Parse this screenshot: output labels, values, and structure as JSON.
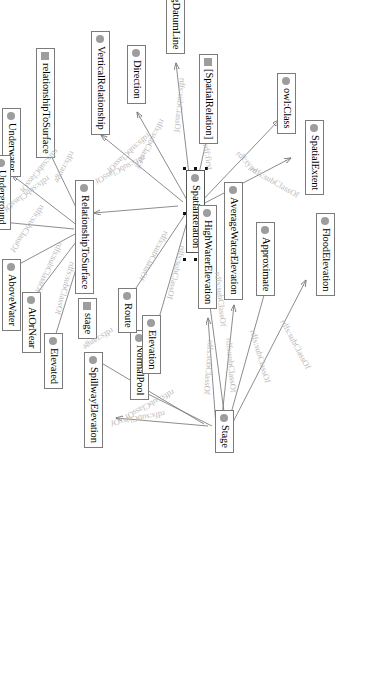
{
  "diagram": {
    "orientation": "rotated-90",
    "caption": "",
    "colors": {
      "node_border": "#7b7b7b",
      "node_fill": "#ffffff",
      "class_icon": "#9d9d9d",
      "edge_stroke": "#6f6f6f",
      "edge_label": "#b9b9b9",
      "selection_handle": "#111111"
    },
    "nodes": [
      {
        "id": "spatialExtent",
        "label": "SpatialExtent",
        "icon": "class-circle-icon",
        "selected": false
      },
      {
        "id": "owlClass",
        "label": "owl:Class",
        "icon": "class-circle-icon",
        "selected": false
      },
      {
        "id": "spatialRelationList",
        "label": "[SpatialRelation]",
        "icon": "property-square-icon",
        "selected": false
      },
      {
        "id": "soundingDatumLine",
        "label": "SoundingDatumLine",
        "icon": "class-circle-icon",
        "selected": false
      },
      {
        "id": "direction",
        "label": "Direction",
        "icon": "class-circle-icon",
        "selected": false
      },
      {
        "id": "verticalRelationship",
        "label": "VerticalRelationship",
        "icon": "class-circle-icon",
        "selected": false
      },
      {
        "id": "spatialRelation",
        "label": "SpatialRelation",
        "icon": "class-circle-icon",
        "selected": true
      },
      {
        "id": "floodElevation",
        "label": "FloodElevation",
        "icon": "class-circle-icon",
        "selected": false
      },
      {
        "id": "approximate",
        "label": "Approximate",
        "icon": "class-circle-icon",
        "selected": false
      },
      {
        "id": "averageWaterElevation",
        "label": "AverageWaterElevation",
        "icon": "class-circle-icon",
        "selected": false
      },
      {
        "id": "highWaterElevation",
        "label": "HighWaterElevation",
        "icon": "class-circle-icon",
        "selected": false
      },
      {
        "id": "stage",
        "label": "Stage",
        "icon": "class-circle-icon",
        "selected": false
      },
      {
        "id": "normalPool",
        "label": "NormalPool",
        "icon": "class-circle-icon",
        "selected": false
      },
      {
        "id": "spillwayElevation",
        "label": "SpillwayElevation",
        "icon": "class-circle-icon",
        "selected": false
      },
      {
        "id": "stageProp",
        "label": "stage",
        "icon": "property-square-icon",
        "selected": false
      },
      {
        "id": "elevation",
        "label": "Elevation",
        "icon": "class-circle-icon",
        "selected": false
      },
      {
        "id": "route",
        "label": "Route",
        "icon": "class-circle-icon",
        "selected": false
      },
      {
        "id": "relationshipToSurface",
        "label": "RelationshipToSurface",
        "icon": "class-circle-icon",
        "selected": false
      },
      {
        "id": "relToSurfaceProp",
        "label": "relationshipToSurface",
        "icon": "property-square-icon",
        "selected": false
      },
      {
        "id": "underwater",
        "label": "Underwater",
        "icon": "class-circle-icon",
        "selected": false
      },
      {
        "id": "underground",
        "label": "Underground",
        "icon": "class-circle-icon",
        "selected": false
      },
      {
        "id": "aboveWater",
        "label": "AboveWater",
        "icon": "class-circle-icon",
        "selected": false
      },
      {
        "id": "atOrNear",
        "label": "AtOrNear",
        "icon": "class-circle-icon",
        "selected": false
      },
      {
        "id": "elevated",
        "label": "Elevated",
        "icon": "class-circle-icon",
        "selected": false
      }
    ],
    "edges": [
      {
        "from": "spatialRelation",
        "to": "owlClass",
        "label": "rdf:type"
      },
      {
        "from": "spatialRelationList",
        "to": "spatialRelation",
        "label": "rdf:first"
      },
      {
        "from": "spatialRelation",
        "to": "spatialExtent",
        "label": "rdfs:subClassOf"
      },
      {
        "from": "soundingDatumLine",
        "to": "spatialRelation",
        "label": "rdfs:subClassOf"
      },
      {
        "from": "direction",
        "to": "spatialRelation",
        "label": "rdfs:subClassOf"
      },
      {
        "from": "verticalRelationship",
        "to": "spatialRelation",
        "label": "rdfs:subClassOf"
      },
      {
        "from": "relationshipToSurface",
        "to": "spatialRelation",
        "label": "rdfs:subClassOf"
      },
      {
        "from": "route",
        "to": "spatialRelation",
        "label": "rdfs:subClassOf"
      },
      {
        "from": "elevation",
        "to": "spatialRelation",
        "label": "rdfs:subClassOf"
      },
      {
        "from": "stage",
        "to": "spatialExtent",
        "label": "rdfs:subClassOf"
      },
      {
        "from": "floodElevation",
        "to": "stage",
        "label": "rdfs:subClassOf"
      },
      {
        "from": "approximate",
        "to": "stage",
        "label": "rdfs:subClassOf"
      },
      {
        "from": "averageWaterElevation",
        "to": "stage",
        "label": "rdfs:subClassOf"
      },
      {
        "from": "highWaterElevation",
        "to": "stage",
        "label": "rdfs:subClassOf"
      },
      {
        "from": "normalPool",
        "to": "stage",
        "label": "rdfs:subClassOf"
      },
      {
        "from": "spillwayElevation",
        "to": "stage",
        "label": "rdfs:subClassOf"
      },
      {
        "from": "stageProp",
        "to": "stage",
        "label": "rdfs:range"
      },
      {
        "from": "relToSurfaceProp",
        "to": "relationshipToSurface",
        "label": "rdfs:range"
      },
      {
        "from": "underwater",
        "to": "relationshipToSurface",
        "label": "rdfs:subClassOf"
      },
      {
        "from": "underground",
        "to": "relationshipToSurface",
        "label": "rdfs:subClassOf"
      },
      {
        "from": "aboveWater",
        "to": "relationshipToSurface",
        "label": "rdfs:subClassOf"
      },
      {
        "from": "atOrNear",
        "to": "relationshipToSurface",
        "label": "rdfs:subClassOf"
      },
      {
        "from": "elevated",
        "to": "relationshipToSurface",
        "label": "rdfs:subClassOf"
      }
    ],
    "edge_labels_rendered": [
      "rdf:type",
      "rdf:first",
      "rdfs:subClassOf",
      "rdfs:subClassOf",
      "rdfs:subClassOf",
      "rdfs:subClassOf",
      "rdfs:subClassOf",
      "rdfs:subClassOf",
      "rdfs:subClassOf",
      "rdfs:subClassOf",
      "rdfs:subClassOf",
      "rdfs:subClassOf",
      "rdfs:subClassOf",
      "rdfs:subClassOf",
      "rdfs:subClassOf",
      "rdfs:subClassOf",
      "rdfs:subClassOf",
      "rdfs:subClassOf",
      "rdfs:subClassOf",
      "rdfs:subClassOf",
      "rdfs:subClassOf",
      "rdfs:range",
      "rdfs:range"
    ]
  }
}
